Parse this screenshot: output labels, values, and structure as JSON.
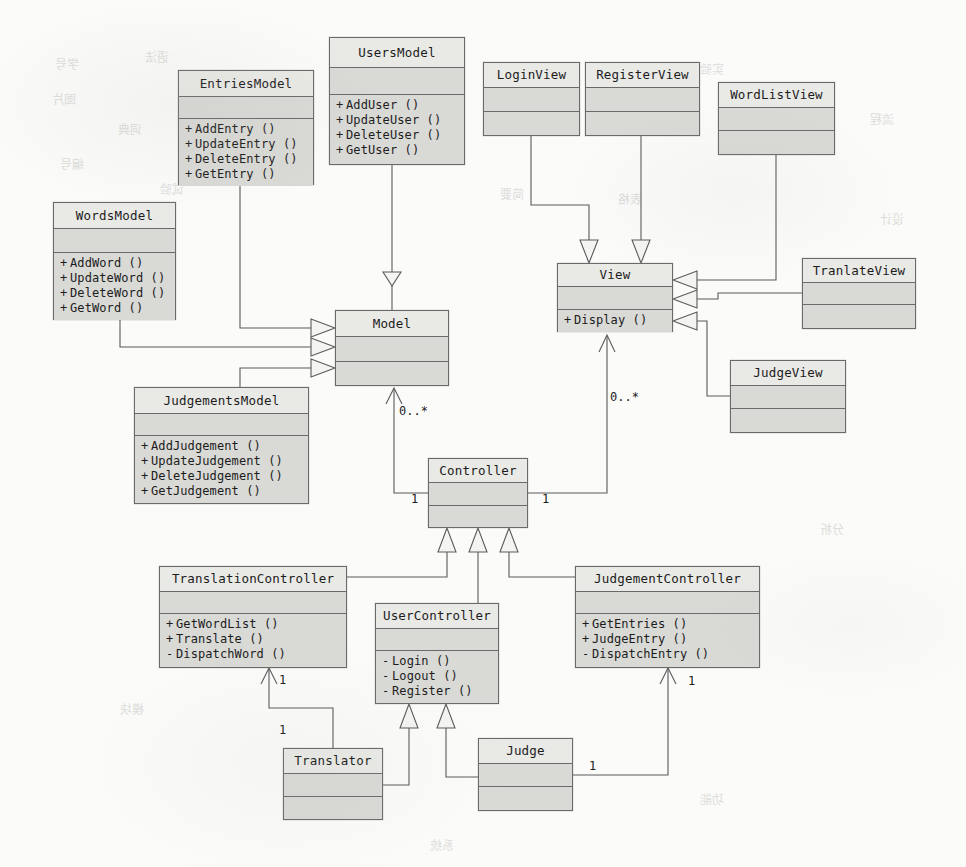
{
  "diagram": {
    "kind": "uml-class-diagram",
    "canvas": {
      "width": 966,
      "height": 867
    },
    "colors": {
      "background": "#fbfbfa",
      "class_fill": "#d9d9d6",
      "class_header_fill": "#e9e9e6",
      "border": "#6a6a6a",
      "text": "#1c1c1c",
      "edge": "#555555"
    }
  },
  "classes": [
    {
      "id": "EntriesModel",
      "name": "EntriesModel",
      "x": 178,
      "y": 70,
      "w": 136,
      "h": 115,
      "name_h": 26,
      "attrs_h": 22,
      "attributes": [],
      "operations": [
        {
          "visibility": "+",
          "text": "AddEntry ()"
        },
        {
          "visibility": "+",
          "text": "UpdateEntry ()"
        },
        {
          "visibility": "+",
          "text": "DeleteEntry ()"
        },
        {
          "visibility": "+",
          "text": "GetEntry ()"
        }
      ]
    },
    {
      "id": "UsersModel",
      "name": "UsersModel",
      "x": 329,
      "y": 37,
      "w": 136,
      "h": 128,
      "name_h": 30,
      "attrs_h": 27,
      "attributes": [],
      "operations": [
        {
          "visibility": "+",
          "text": "AddUser ()"
        },
        {
          "visibility": "+",
          "text": "UpdateUser ()"
        },
        {
          "visibility": "+",
          "text": "DeleteUser ()"
        },
        {
          "visibility": "+",
          "text": "GetUser ()"
        }
      ]
    },
    {
      "id": "LoginView",
      "name": "LoginView",
      "x": 483,
      "y": 62,
      "w": 97,
      "h": 74,
      "name_h": 25,
      "attrs_h": 24,
      "attributes": [],
      "operations": []
    },
    {
      "id": "RegisterView",
      "name": "RegisterView",
      "x": 585,
      "y": 62,
      "w": 115,
      "h": 74,
      "name_h": 25,
      "attrs_h": 24,
      "attributes": [],
      "operations": []
    },
    {
      "id": "WordListView",
      "name": "WordListView",
      "x": 718,
      "y": 82,
      "w": 117,
      "h": 73,
      "name_h": 25,
      "attrs_h": 23,
      "attributes": [],
      "operations": []
    },
    {
      "id": "WordsModel",
      "name": "WordsModel",
      "x": 53,
      "y": 202,
      "w": 123,
      "h": 118,
      "name_h": 26,
      "attrs_h": 24,
      "attributes": [],
      "operations": [
        {
          "visibility": "+",
          "text": "AddWord ()"
        },
        {
          "visibility": "+",
          "text": "UpdateWord ()"
        },
        {
          "visibility": "+",
          "text": "DeleteWord ()"
        },
        {
          "visibility": "+",
          "text": "GetWord ()"
        }
      ]
    },
    {
      "id": "Model",
      "name": "Model",
      "x": 335,
      "y": 310,
      "w": 114,
      "h": 76,
      "name_h": 26,
      "attrs_h": 25,
      "attributes": [],
      "operations": []
    },
    {
      "id": "View",
      "name": "View",
      "x": 557,
      "y": 263,
      "w": 116,
      "h": 69,
      "name_h": 23,
      "attrs_h": 23,
      "attributes": [],
      "operations": [
        {
          "visibility": "+",
          "text": "Display ()"
        }
      ]
    },
    {
      "id": "TranlateView",
      "name": "TranlateView",
      "x": 802,
      "y": 258,
      "w": 114,
      "h": 71,
      "name_h": 24,
      "attrs_h": 22,
      "attributes": [],
      "operations": []
    },
    {
      "id": "JudgeView",
      "name": "JudgeView",
      "x": 730,
      "y": 360,
      "w": 116,
      "h": 73,
      "name_h": 25,
      "attrs_h": 23,
      "attributes": [],
      "operations": []
    },
    {
      "id": "JudgementsModel",
      "name": "JudgementsModel",
      "x": 134,
      "y": 387,
      "w": 175,
      "h": 117,
      "name_h": 26,
      "attrs_h": 22,
      "attributes": [],
      "operations": [
        {
          "visibility": "+",
          "text": "AddJudgement ()"
        },
        {
          "visibility": "+",
          "text": "UpdateJudgement ()"
        },
        {
          "visibility": "+",
          "text": "DeleteJudgement ()"
        },
        {
          "visibility": "+",
          "text": "GetJudgement ()"
        }
      ]
    },
    {
      "id": "Controller",
      "name": "Controller",
      "x": 428,
      "y": 458,
      "w": 100,
      "h": 70,
      "name_h": 24,
      "attrs_h": 23,
      "attributes": [],
      "operations": []
    },
    {
      "id": "TranslationController",
      "name": "TranslationController",
      "x": 159,
      "y": 566,
      "w": 188,
      "h": 102,
      "name_h": 25,
      "attrs_h": 22,
      "attributes": [],
      "operations": [
        {
          "visibility": "+",
          "text": "GetWordList ()"
        },
        {
          "visibility": "+",
          "text": "Translate ()"
        },
        {
          "visibility": "-",
          "text": "DispatchWord ()"
        }
      ]
    },
    {
      "id": "UserController",
      "name": "UserController",
      "x": 375,
      "y": 603,
      "w": 124,
      "h": 101,
      "name_h": 25,
      "attrs_h": 22,
      "attributes": [],
      "operations": [
        {
          "visibility": "-",
          "text": "Login ()"
        },
        {
          "visibility": "-",
          "text": "Logout ()"
        },
        {
          "visibility": "-",
          "text": "Register ()"
        }
      ]
    },
    {
      "id": "JudgementController",
      "name": "JudgementController",
      "x": 575,
      "y": 566,
      "w": 185,
      "h": 102,
      "name_h": 25,
      "attrs_h": 22,
      "attributes": [],
      "operations": [
        {
          "visibility": "+",
          "text": "GetEntries ()"
        },
        {
          "visibility": "+",
          "text": "JudgeEntry ()"
        },
        {
          "visibility": "-",
          "text": "DispatchEntry ()"
        }
      ]
    },
    {
      "id": "Translator",
      "name": "Translator",
      "x": 283,
      "y": 748,
      "w": 100,
      "h": 72,
      "name_h": 25,
      "attrs_h": 23,
      "attributes": [],
      "operations": []
    },
    {
      "id": "Judge",
      "name": "Judge",
      "x": 478,
      "y": 738,
      "w": 95,
      "h": 73,
      "name_h": 25,
      "attrs_h": 23,
      "attributes": [],
      "operations": []
    }
  ],
  "multiplicities": [
    {
      "id": "model-controller-many",
      "label": "0..*",
      "x": 399,
      "y": 404
    },
    {
      "id": "view-controller-many",
      "label": "0..*",
      "x": 610,
      "y": 390
    },
    {
      "id": "controller-model-one",
      "label": "1",
      "x": 411,
      "y": 492
    },
    {
      "id": "controller-view-one",
      "label": "1",
      "x": 542,
      "y": 492
    },
    {
      "id": "translationcontroller-one",
      "label": "1",
      "x": 279,
      "y": 673
    },
    {
      "id": "translator-one",
      "label": "1",
      "x": 279,
      "y": 723
    },
    {
      "id": "judgementcontroller-one",
      "label": "1",
      "x": 688,
      "y": 674
    },
    {
      "id": "judge-one",
      "label": "1",
      "x": 589,
      "y": 759
    }
  ],
  "relations": [
    {
      "id": "entriesmodel-model",
      "from": "EntriesModel",
      "to": "Model",
      "type": "generalization"
    },
    {
      "id": "wordsmodel-model",
      "from": "WordsModel",
      "to": "Model",
      "type": "generalization"
    },
    {
      "id": "judgementsmodel-model",
      "from": "JudgementsModel",
      "to": "Model",
      "type": "generalization"
    },
    {
      "id": "usersmodel-model",
      "from": "UsersModel",
      "to": "Model",
      "type": "generalization"
    },
    {
      "id": "loginview-view",
      "from": "LoginView",
      "to": "View",
      "type": "generalization"
    },
    {
      "id": "registerview-view",
      "from": "RegisterView",
      "to": "View",
      "type": "generalization"
    },
    {
      "id": "wordlistview-view",
      "from": "WordListView",
      "to": "View",
      "type": "generalization"
    },
    {
      "id": "tranlateview-view",
      "from": "TranlateView",
      "to": "View",
      "type": "generalization"
    },
    {
      "id": "judgeview-view",
      "from": "JudgeView",
      "to": "View",
      "type": "generalization"
    },
    {
      "id": "controller-model",
      "from": "Controller",
      "to": "Model",
      "type": "association"
    },
    {
      "id": "controller-view",
      "from": "Controller",
      "to": "View",
      "type": "association"
    },
    {
      "id": "translationcontroller-controller",
      "from": "TranslationController",
      "to": "Controller",
      "type": "generalization"
    },
    {
      "id": "usercontroller-controller",
      "from": "UserController",
      "to": "Controller",
      "type": "generalization"
    },
    {
      "id": "judgementcontroller-controller",
      "from": "JudgementController",
      "to": "Controller",
      "type": "generalization"
    },
    {
      "id": "translator-usercontroller",
      "from": "Translator",
      "to": "UserController",
      "type": "generalization"
    },
    {
      "id": "judge-usercontroller",
      "from": "Judge",
      "to": "UserController",
      "type": "generalization"
    },
    {
      "id": "translator-translationcontroller",
      "from": "Translator",
      "to": "TranslationController",
      "type": "association"
    },
    {
      "id": "judge-judgementcontroller",
      "from": "Judge",
      "to": "JudgementController",
      "type": "association"
    }
  ],
  "ghost_marks": [
    {
      "text": "学号",
      "x": 55,
      "y": 55
    },
    {
      "text": "语法",
      "x": 145,
      "y": 48
    },
    {
      "text": "图片",
      "x": 52,
      "y": 90
    },
    {
      "text": "词典",
      "x": 118,
      "y": 120
    },
    {
      "text": "编号",
      "x": 60,
      "y": 155
    },
    {
      "text": "试验",
      "x": 160,
      "y": 180
    },
    {
      "text": "简要",
      "x": 500,
      "y": 185
    },
    {
      "text": "表格",
      "x": 618,
      "y": 190
    },
    {
      "text": "实验",
      "x": 700,
      "y": 60
    },
    {
      "text": "流程",
      "x": 870,
      "y": 110
    },
    {
      "text": "设计",
      "x": 880,
      "y": 210
    },
    {
      "text": "模块",
      "x": 120,
      "y": 700
    },
    {
      "text": "系统",
      "x": 430,
      "y": 836
    },
    {
      "text": "功能",
      "x": 700,
      "y": 790
    },
    {
      "text": "分析",
      "x": 820,
      "y": 520
    }
  ]
}
